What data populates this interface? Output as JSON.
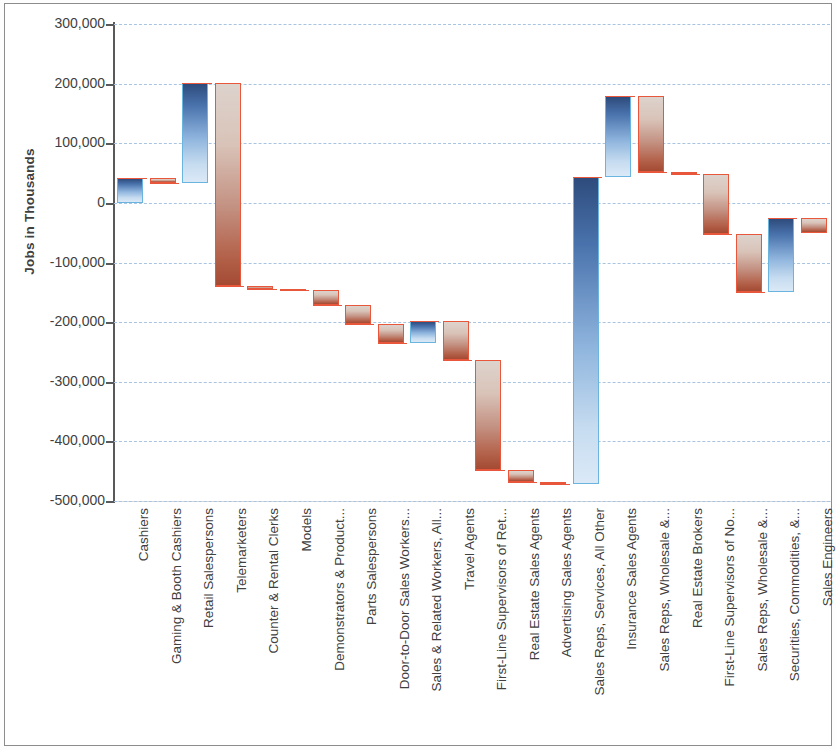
{
  "chart_data": {
    "type": "bar",
    "subtype": "waterfall",
    "title": "",
    "xlabel": "",
    "ylabel": "Jobs in Thousands",
    "ylim": [
      -500000,
      300000
    ],
    "ytick_step": 100000,
    "ytick_labels": [
      "300,000",
      "200,000",
      "100,000",
      "0",
      "-100,000",
      "-200,000",
      "-300,000",
      "-400,000",
      "-500,000"
    ],
    "ytick_values": [
      300000,
      200000,
      100000,
      0,
      -100000,
      -200000,
      -300000,
      -400000,
      -500000
    ],
    "grid": true,
    "grid_style": "dashed",
    "legend": "none",
    "colors": {
      "increase": "#4a73ad",
      "increase_border": "#6ab4e0",
      "decrease": "#c08470",
      "decrease_border": "#e8573b",
      "gridline": "#a8c4e0",
      "axis": "#595959",
      "text": "#404040",
      "frame": "#8c8c8c"
    },
    "categories": [
      "Cashiers",
      "Gaming & Booth Cashiers",
      "Retail Salespersons",
      "Telemarketers",
      "Counter & Rental Clerks",
      "Models",
      "Demonstrators & Product...",
      "Parts Salespersons",
      "Door-to-Door Sales Workers...",
      "Sales & Related Workers, All...",
      "Travel Agents",
      "First-Line Supervisors of Ret...",
      "Real Estate Sales Agents",
      "Advertising Sales Agents",
      "Sales Reps, Services, All Other",
      "Insurance Sales Agents",
      "Sales Reps, Wholesale &...",
      "Real Estate Brokers",
      "First-Line Supervisors of No...",
      "Sales Reps, Wholesale &...",
      "Securities, Commodities, &...",
      "Sales Engineers"
    ],
    "deltas": [
      42000,
      -9000,
      168000,
      -340000,
      -5000,
      -2000,
      -25000,
      -32000,
      -32000,
      37000,
      -65000,
      -185000,
      -20000,
      -3000,
      515000,
      135000,
      -128000,
      -3000,
      -100000,
      -98000,
      125000,
      -25000
    ],
    "cumulative_start": [
      0,
      42000,
      33000,
      201000,
      -139000,
      -144000,
      -146000,
      -171000,
      -203000,
      -235000,
      -198000,
      -263000,
      -448000,
      -468000,
      -471000,
      44000,
      179000,
      51000,
      48000,
      -52000,
      -150000,
      -25000
    ],
    "cumulative_end": [
      42000,
      33000,
      201000,
      -139000,
      -144000,
      -146000,
      -171000,
      -203000,
      -235000,
      -198000,
      -263000,
      -448000,
      -468000,
      -471000,
      44000,
      179000,
      51000,
      48000,
      -52000,
      -150000,
      -25000,
      -50000
    ],
    "directions": [
      "up",
      "down",
      "up",
      "down",
      "down",
      "down",
      "down",
      "down",
      "down",
      "up",
      "down",
      "down",
      "down",
      "down",
      "up",
      "up",
      "down",
      "down",
      "down",
      "down",
      "up",
      "down"
    ]
  }
}
